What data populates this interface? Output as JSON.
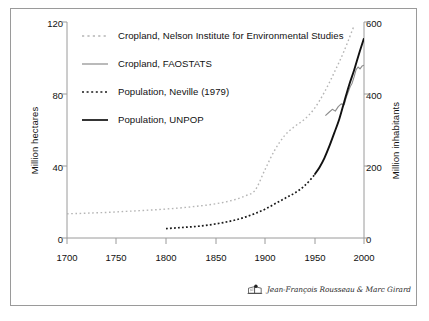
{
  "chart_data": {
    "type": "line",
    "title": "",
    "xlabel": "",
    "ylabel": "Million hectares",
    "ylabel_right": "Million inhabitants",
    "xlim": [
      1700,
      2000
    ],
    "ylim": [
      0,
      120
    ],
    "ylim_right": [
      0,
      600
    ],
    "xticks": [
      "1700",
      "1750",
      "1800",
      "1850",
      "1900",
      "1950",
      "2000"
    ],
    "yticks_left": [
      "0",
      "40",
      "80",
      "120"
    ],
    "yticks_right": [
      "0",
      "200",
      "400",
      "600"
    ],
    "grid": false,
    "legend_position": "upper left inside",
    "series": [
      {
        "name": "Cropland, Nelson Institute for Environmental Studies",
        "axis": "left",
        "units": "Million hectares",
        "color": "#b5b5b5",
        "style": "dotted",
        "x": [
          1700,
          1710,
          1720,
          1730,
          1740,
          1750,
          1760,
          1770,
          1780,
          1790,
          1800,
          1810,
          1820,
          1830,
          1840,
          1850,
          1860,
          1870,
          1880,
          1890,
          1900,
          1910,
          1920,
          1930,
          1940,
          1950,
          1960,
          1970,
          1980,
          1990
        ],
        "values": [
          13.5,
          13.6,
          13.8,
          14.0,
          14.2,
          14.5,
          14.8,
          15.1,
          15.4,
          15.7,
          16.1,
          16.5,
          17.0,
          17.6,
          18.2,
          19.0,
          20.0,
          21.4,
          23.4,
          26.5,
          38.0,
          49.0,
          57.0,
          62.0,
          66.0,
          72.0,
          81.0,
          92.0,
          104.0,
          118.0
        ]
      },
      {
        "name": "Cropland, FAOSTATS",
        "axis": "left",
        "units": "Million hectares",
        "color": "#8c8c8c",
        "style": "solid",
        "x": [
          1961,
          1965,
          1968,
          1971,
          1974,
          1977,
          1980,
          1982,
          1984,
          1986,
          1988,
          1990,
          1992,
          1994,
          1996,
          1998,
          2000
        ],
        "values": [
          68.0,
          70.0,
          71.5,
          70.5,
          73.0,
          74.5,
          74.0,
          78.0,
          81.0,
          84.0,
          86.0,
          89.5,
          93.5,
          95.0,
          94.0,
          95.5,
          96.0
        ]
      },
      {
        "name": "Population, Neville (1979)",
        "axis": "right",
        "units": "Million inhabitants",
        "color": "#1a1a1a",
        "style": "dotted",
        "x": [
          1800,
          1810,
          1820,
          1830,
          1840,
          1850,
          1860,
          1870,
          1880,
          1890,
          1900,
          1910,
          1920,
          1930,
          1940,
          1950
        ],
        "values": [
          26,
          28,
          30,
          32,
          35,
          39,
          44,
          50,
          58,
          68,
          80,
          95,
          110,
          125,
          145,
          175
        ]
      },
      {
        "name": "Population, UNPOP",
        "axis": "right",
        "units": "Million inhabitants",
        "color": "#111111",
        "style": "solid",
        "x": [
          1950,
          1955,
          1960,
          1965,
          1970,
          1975,
          1980,
          1985,
          1990,
          1995,
          2000
        ],
        "values": [
          176,
          196,
          222,
          255,
          292,
          330,
          378,
          425,
          466,
          512,
          555
        ]
      }
    ]
  },
  "axes": {
    "left_title": "Million hectares",
    "right_title": "Million inhabitants"
  },
  "legend": {
    "items": [
      {
        "label": "Cropland, Nelson Institute for Environmental Studies",
        "color": "#b5b5b5",
        "style": "dotted"
      },
      {
        "label": "Cropland, FAOSTATS",
        "color": "#8c8c8c",
        "style": "solid"
      },
      {
        "label": "Population, Neville (1979)",
        "color": "#1a1a1a",
        "style": "dotted"
      },
      {
        "label": "Population, UNPOP",
        "color": "#111111",
        "style": "solid"
      }
    ]
  },
  "credit": {
    "text": "Jean-François Rousseau & Marc Girard",
    "logo": "book-logo-icon"
  }
}
